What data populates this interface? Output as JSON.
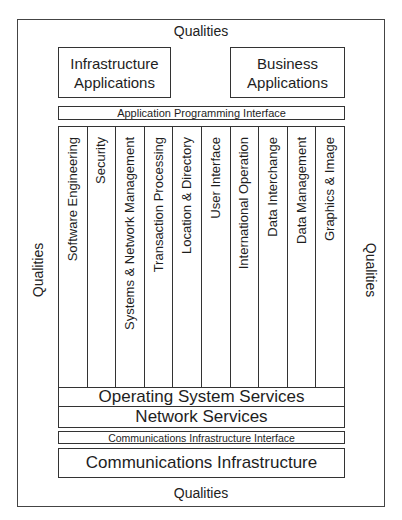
{
  "diagram": {
    "qualities": {
      "top": "Qualities",
      "bottom": "Qualities",
      "left": "Qualities",
      "right": "Qualities"
    },
    "applications": {
      "infrastructure": {
        "line1": "Infrastructure",
        "line2": "Applications"
      },
      "business": {
        "line1": "Business",
        "line2": "Applications"
      }
    },
    "api": "Application Programming Interface",
    "service_columns": [
      "Software Engineering",
      "Security",
      "Systems & Network Management",
      "Transaction Processing",
      "Location & Directory",
      "User Interface",
      "International Operation",
      "Data Interchange",
      "Data Management",
      "Graphics & Image"
    ],
    "operating_system_services": "Operating System Services",
    "network_services": "Network Services",
    "communications_infrastructure_interface": "Communications Infrastructure Interface",
    "communications_infrastructure": "Communications Infrastructure"
  }
}
